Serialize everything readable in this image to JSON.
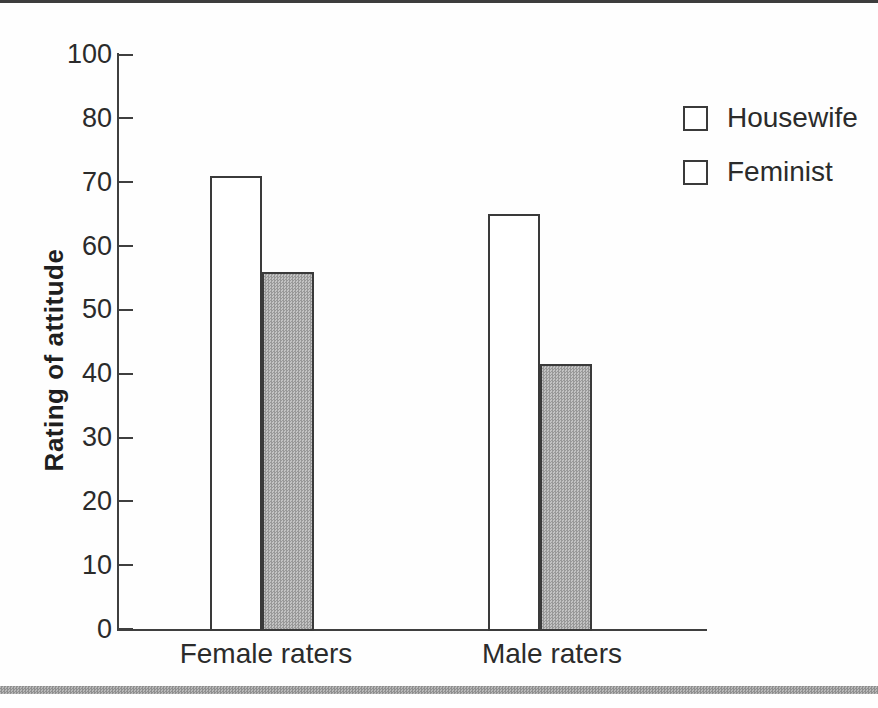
{
  "figure": {
    "background_color": "#ffffff",
    "top_rule_color": "#3d3d3d",
    "bottom_rule_color": "#a3a3a3",
    "text_color": "#2b2b2b",
    "line_color": "#3f3f3f"
  },
  "chart_data": {
    "type": "bar",
    "title": "",
    "xlabel": "",
    "ylabel": "Rating of attitude",
    "categories": [
      "Female raters",
      "Male raters"
    ],
    "series": [
      {
        "name": "Housewife",
        "values": [
          71,
          65
        ],
        "fill": "#ffffff",
        "pattern": "solid-white"
      },
      {
        "name": "Feminist",
        "values": [
          56,
          41.5
        ],
        "fill": "#b5b5b5",
        "pattern": "halftone-gray"
      }
    ],
    "ytick_labels": [
      "100",
      "80",
      "70",
      "60",
      "50",
      "40",
      "30",
      "20",
      "10",
      "0"
    ],
    "ytick_note": "ticks evenly spaced as printed; 90 is not labeled in source figure",
    "ylim": [
      0,
      100
    ],
    "grid": false,
    "legend_position": "top-right",
    "legend_items": [
      {
        "label": "Housewife",
        "swatch": "white-square"
      },
      {
        "label": "Feminist",
        "swatch": "gray-halftone-square"
      }
    ]
  }
}
